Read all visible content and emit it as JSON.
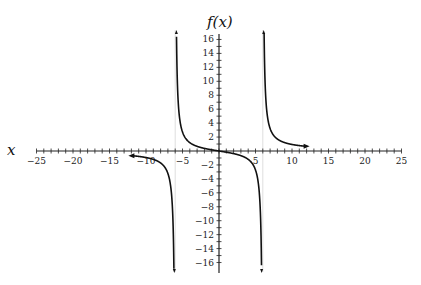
{
  "chart_data": {
    "type": "line",
    "title": "",
    "xlabel": "x",
    "ylabel": "f(x)",
    "xlim": [
      -25,
      25
    ],
    "ylim": [
      -17,
      17
    ],
    "grid": false,
    "x_ticks": {
      "major_step": 5,
      "minor_step": 1,
      "labels": [
        "-25",
        "-20",
        "-15",
        "-10",
        "-5",
        "5",
        "10",
        "15",
        "20",
        "25"
      ],
      "label_values": [
        -25,
        -20,
        -15,
        -10,
        -5,
        5,
        10,
        15,
        20,
        25
      ]
    },
    "y_ticks": {
      "minor_step": 1,
      "labels": [
        "16",
        "14",
        "12",
        "10",
        "8",
        "6",
        "4",
        "2",
        "-2",
        "-4",
        "-6",
        "-8",
        "-10",
        "-12",
        "-14",
        "-16"
      ],
      "label_values": [
        16,
        14,
        12,
        10,
        8,
        6,
        4,
        2,
        -2,
        -4,
        -6,
        -8,
        -10,
        -12,
        -14,
        -16
      ]
    },
    "vertical_asymptotes": [
      -6,
      6
    ],
    "function_description": "Rational function with vertical asymptotes at x = -6 and x = 6, passing through the origin and decreasing in the middle branch; approximately f(x) = 6x/(x^2 - 36)",
    "series": [
      {
        "name": "left branch",
        "domain": [
          -12,
          -6.1
        ],
        "points": [
          [
            -12,
            -0.67
          ],
          [
            -10,
            -0.94
          ],
          [
            -8,
            -1.71
          ],
          [
            -7,
            -3.23
          ],
          [
            -6.5,
            -6.24
          ],
          [
            -6.2,
            -15.3
          ]
        ],
        "end_arrow": "left"
      },
      {
        "name": "middle branch",
        "domain": [
          -5.9,
          5.9
        ],
        "points": [
          [
            -5.9,
            29.8
          ],
          [
            -5.7,
            9.3
          ],
          [
            -5,
            2.73
          ],
          [
            -4,
            1.2
          ],
          [
            -2,
            0.38
          ],
          [
            0,
            0
          ],
          [
            2,
            -0.38
          ],
          [
            4,
            -1.2
          ],
          [
            5,
            -2.73
          ],
          [
            5.7,
            -9.3
          ],
          [
            5.9,
            -29.8
          ]
        ]
      },
      {
        "name": "right branch",
        "domain": [
          6.1,
          12
        ],
        "points": [
          [
            6.2,
            15.3
          ],
          [
            6.5,
            6.24
          ],
          [
            7,
            3.23
          ],
          [
            8,
            1.71
          ],
          [
            10,
            0.94
          ],
          [
            12,
            0.67
          ]
        ],
        "end_arrow": "right"
      }
    ]
  }
}
